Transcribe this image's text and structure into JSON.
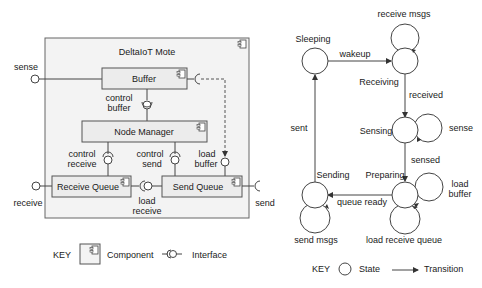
{
  "component_diagram": {
    "title": "DeltaIoT Mote",
    "components": [
      {
        "id": "buffer",
        "label": "Buffer"
      },
      {
        "id": "node_manager",
        "label": "Node Manager"
      },
      {
        "id": "receive_queue",
        "label": "Receive Queue"
      },
      {
        "id": "send_queue",
        "label": "Send Queue"
      }
    ],
    "interfaces": {
      "sense": "sense",
      "control_buffer_1": "control",
      "control_buffer_2": "buffer",
      "control_receive_1": "control",
      "control_receive_2": "receive",
      "control_send_1": "control",
      "control_send_2": "send",
      "load_buffer_1": "load",
      "load_buffer_2": "buffer",
      "load_receive_1": "load",
      "load_receive_2": "receive",
      "receive": "receive",
      "send": "send"
    },
    "key": {
      "label": "KEY",
      "component": "Component",
      "interface": "Interface"
    }
  },
  "state_diagram": {
    "states": {
      "sleeping": "Sleeping",
      "receiving": "Receiving",
      "sensing": "Sensing",
      "preparing": "Preparing",
      "sending": "Sending"
    },
    "transitions": {
      "wakeup": "wakeup",
      "receive_msgs": "receive msgs",
      "received": "received",
      "sense": "sense",
      "sensed": "sensed",
      "load_buffer_1": "load",
      "load_buffer_2": "buffer",
      "load_receive_queue": "load receive queue",
      "queue_ready": "queue ready",
      "send_msgs": "send msgs",
      "sent": "sent"
    },
    "key": {
      "label": "KEY",
      "state": "State",
      "transition": "Transition"
    }
  }
}
